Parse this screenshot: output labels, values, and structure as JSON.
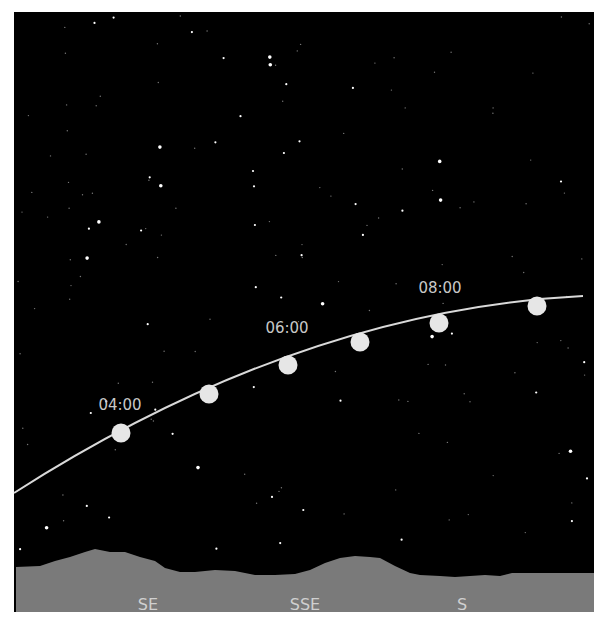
{
  "chart": {
    "type": "sky-path",
    "colors": {
      "sky": "#000000",
      "ground": "#7a7a7a",
      "path": "#d9d9d9",
      "marker": "#e6e6e6",
      "label": "#c8c8c8",
      "border": "#ffffff"
    },
    "time_labels": [
      {
        "text": "04:00",
        "x": 120,
        "y": 410
      },
      {
        "text": "06:00",
        "x": 287,
        "y": 333
      },
      {
        "text": "08:00",
        "x": 440,
        "y": 293
      }
    ],
    "markers": [
      {
        "x": 121,
        "y": 433
      },
      {
        "x": 209,
        "y": 394
      },
      {
        "x": 288,
        "y": 365
      },
      {
        "x": 360,
        "y": 342
      },
      {
        "x": 439,
        "y": 323
      },
      {
        "x": 537,
        "y": 306
      }
    ],
    "directions": [
      {
        "label": "SE",
        "x": 148,
        "y": 610
      },
      {
        "label": "SSE",
        "x": 305,
        "y": 610
      },
      {
        "label": "S",
        "x": 462,
        "y": 610
      }
    ]
  }
}
